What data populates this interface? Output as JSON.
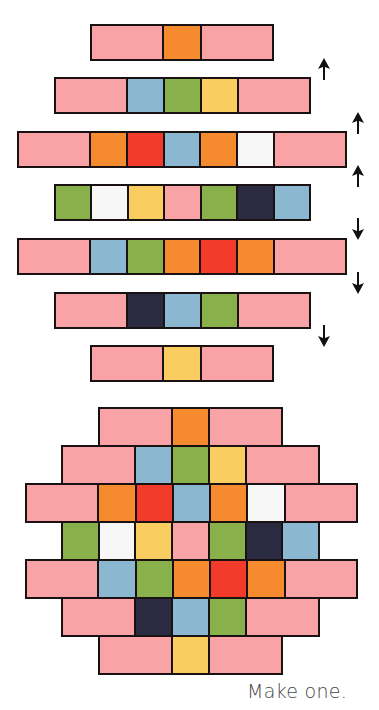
{
  "palette": {
    "P": "#F9A3A6",
    "O": "#F58A2E",
    "R": "#F33B2C",
    "B": "#8BB8D0",
    "G": "#88B04B",
    "Y": "#F9CD5F",
    "W": "#F7F7F7",
    "N": "#2A2A40"
  },
  "palette_names": {
    "P": "pink",
    "O": "orange",
    "R": "red",
    "B": "blue",
    "G": "green",
    "Y": "yellow",
    "W": "white",
    "N": "navy"
  },
  "exploded": {
    "unit": 36.7,
    "row_height": 37,
    "rows": [
      {
        "left": 90,
        "top": 24,
        "cells": [
          [
            "P",
            2
          ],
          [
            "O",
            1
          ],
          [
            "P",
            2
          ]
        ]
      },
      {
        "left": 54,
        "top": 77,
        "cells": [
          [
            "P",
            2
          ],
          [
            "B",
            1
          ],
          [
            "G",
            1
          ],
          [
            "Y",
            1
          ],
          [
            "P",
            2
          ]
        ]
      },
      {
        "left": 17,
        "top": 131,
        "cells": [
          [
            "P",
            2
          ],
          [
            "O",
            1
          ],
          [
            "R",
            1
          ],
          [
            "B",
            1
          ],
          [
            "O",
            1
          ],
          [
            "W",
            1
          ],
          [
            "P",
            2
          ]
        ]
      },
      {
        "left": 54,
        "top": 184,
        "cells": [
          [
            "G",
            1
          ],
          [
            "W",
            1
          ],
          [
            "Y",
            1
          ],
          [
            "P",
            1
          ],
          [
            "G",
            1
          ],
          [
            "N",
            1
          ],
          [
            "B",
            1
          ]
        ]
      },
      {
        "left": 17,
        "top": 238,
        "cells": [
          [
            "P",
            2
          ],
          [
            "B",
            1
          ],
          [
            "G",
            1
          ],
          [
            "O",
            1
          ],
          [
            "R",
            1
          ],
          [
            "O",
            1
          ],
          [
            "P",
            2
          ]
        ]
      },
      {
        "left": 54,
        "top": 292,
        "cells": [
          [
            "P",
            2
          ],
          [
            "N",
            1
          ],
          [
            "B",
            1
          ],
          [
            "G",
            1
          ],
          [
            "P",
            2
          ]
        ]
      },
      {
        "left": 90,
        "top": 345,
        "cells": [
          [
            "P",
            2
          ],
          [
            "Y",
            1
          ],
          [
            "P",
            2
          ]
        ]
      }
    ]
  },
  "arrows": [
    {
      "direction": "up",
      "x": 318,
      "y": 58
    },
    {
      "direction": "up",
      "x": 352,
      "y": 112
    },
    {
      "direction": "up",
      "x": 352,
      "y": 165
    },
    {
      "direction": "down",
      "x": 352,
      "y": 218
    },
    {
      "direction": "down",
      "x": 352,
      "y": 272
    },
    {
      "direction": "down",
      "x": 318,
      "y": 325
    }
  ],
  "assembled": {
    "unit": 37,
    "row_height": 38,
    "top": 407,
    "rows": [
      {
        "left": 98,
        "cells": [
          [
            "P",
            2
          ],
          [
            "O",
            1
          ],
          [
            "P",
            2
          ]
        ]
      },
      {
        "left": 61,
        "cells": [
          [
            "P",
            2
          ],
          [
            "B",
            1
          ],
          [
            "G",
            1
          ],
          [
            "Y",
            1
          ],
          [
            "P",
            2
          ]
        ]
      },
      {
        "left": 25,
        "cells": [
          [
            "P",
            2
          ],
          [
            "O",
            1
          ],
          [
            "R",
            1
          ],
          [
            "B",
            1
          ],
          [
            "O",
            1
          ],
          [
            "W",
            1
          ],
          [
            "P",
            2
          ]
        ]
      },
      {
        "left": 61,
        "cells": [
          [
            "G",
            1
          ],
          [
            "W",
            1
          ],
          [
            "Y",
            1
          ],
          [
            "P",
            1
          ],
          [
            "G",
            1
          ],
          [
            "N",
            1
          ],
          [
            "B",
            1
          ]
        ]
      },
      {
        "left": 25,
        "cells": [
          [
            "P",
            2
          ],
          [
            "B",
            1
          ],
          [
            "G",
            1
          ],
          [
            "O",
            1
          ],
          [
            "R",
            1
          ],
          [
            "O",
            1
          ],
          [
            "P",
            2
          ]
        ]
      },
      {
        "left": 61,
        "cells": [
          [
            "P",
            2
          ],
          [
            "N",
            1
          ],
          [
            "B",
            1
          ],
          [
            "G",
            1
          ],
          [
            "P",
            2
          ]
        ]
      },
      {
        "left": 98,
        "cells": [
          [
            "P",
            2
          ],
          [
            "Y",
            1
          ],
          [
            "P",
            2
          ]
        ]
      }
    ]
  },
  "caption": "Make one."
}
